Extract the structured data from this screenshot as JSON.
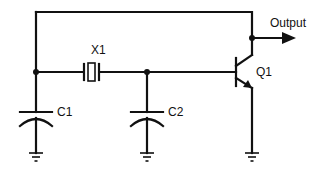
{
  "diagram": {
    "type": "circuit-schematic",
    "components": [
      {
        "id": "X1",
        "label": "X1",
        "kind": "crystal"
      },
      {
        "id": "C1",
        "label": "C1",
        "kind": "capacitor"
      },
      {
        "id": "C2",
        "label": "C2",
        "kind": "capacitor"
      },
      {
        "id": "Q1",
        "label": "Q1",
        "kind": "npn-transistor"
      }
    ],
    "output_label": "Output",
    "ground_count": 3,
    "colors": {
      "line": "#111111",
      "background": "#ffffff"
    }
  }
}
